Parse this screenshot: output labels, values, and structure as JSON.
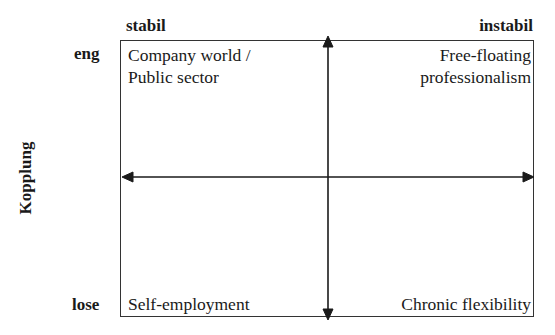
{
  "columns": {
    "left": "stabil",
    "right": "instabil"
  },
  "rows": {
    "top": "eng",
    "bottom": "lose"
  },
  "y_axis_label": "Kopplung",
  "quadrants": {
    "top_left": [
      "Company world /",
      "Public sector"
    ],
    "top_right": [
      "Free-floating",
      "professionalism"
    ],
    "bottom_left": [
      "Self-employment"
    ],
    "bottom_right": [
      "Chronic flexibility"
    ]
  },
  "colors": {
    "line": "#1a1a1a",
    "background": "#ffffff"
  }
}
